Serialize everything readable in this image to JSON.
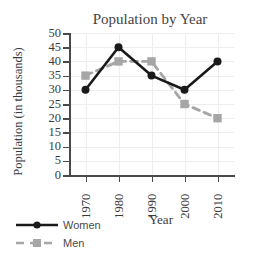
{
  "page": {
    "clipped_header_text": "",
    "background_color": "#ffffff"
  },
  "chart_data": {
    "type": "line",
    "title": "Population by Year",
    "xlabel": "Year",
    "ylabel": "Population (in thousands)",
    "categories": [
      "1970",
      "1980",
      "1990",
      "2000",
      "2010"
    ],
    "x": [
      1970,
      1980,
      1990,
      2000,
      2010
    ],
    "series": [
      {
        "name": "Women",
        "values": [
          30,
          45,
          35,
          30,
          40
        ],
        "color": "#1a1a1a",
        "linestyle": "solid",
        "marker": "circle"
      },
      {
        "name": "Men",
        "values": [
          35,
          40,
          40,
          25,
          20
        ],
        "color": "#a6a6a6",
        "linestyle": "dashed",
        "marker": "square"
      }
    ],
    "ylim": [
      0,
      50
    ],
    "ytick_labels": [
      "0",
      "5",
      "10",
      "15",
      "20",
      "25",
      "30",
      "35",
      "40",
      "45",
      "50"
    ],
    "ytick_values": [
      0,
      5,
      10,
      15,
      20,
      25,
      30,
      35,
      40,
      45,
      50
    ],
    "xtick_labels": [
      "1970",
      "1980",
      "1990",
      "2000",
      "2010"
    ],
    "grid": true,
    "grid_color": "#ededed",
    "legend_position": "lower-left-outside",
    "axis_color": "#4a4a4a",
    "xtick_rotation": 90
  },
  "legend": {
    "entries": [
      {
        "label": "Women"
      },
      {
        "label": "Men"
      }
    ]
  }
}
